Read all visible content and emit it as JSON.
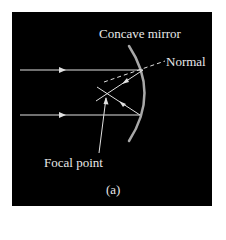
{
  "figure": {
    "labels": {
      "mirror": "Concave mirror",
      "normal": "Normal",
      "focal_point": "Focal point",
      "caption": "(a)"
    },
    "colors": {
      "background": "#000000",
      "page": "#ffffff",
      "rays": "#e0e0e0",
      "mirror": "#a8a8a8",
      "text": "#e8e8e8"
    }
  }
}
